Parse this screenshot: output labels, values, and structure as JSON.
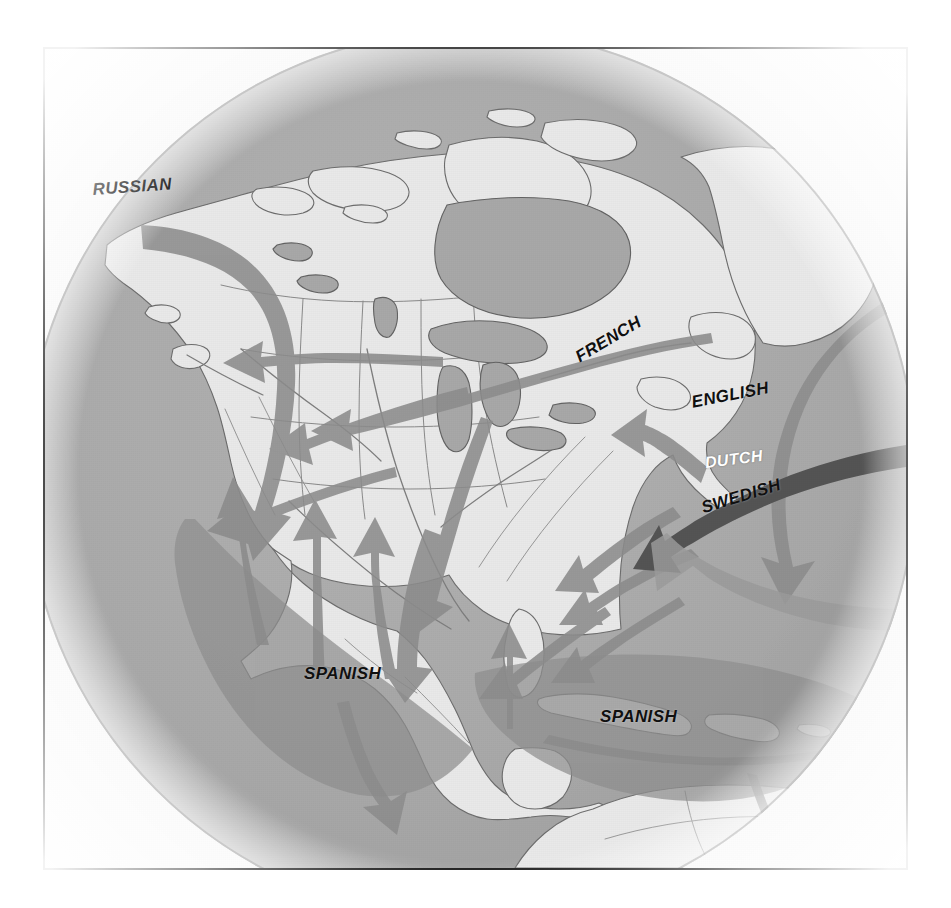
{
  "map": {
    "title": "Colonial language expansion in North America",
    "type": "thematic historical map",
    "projection": "orthographic globe centered on North America",
    "colors": {
      "ocean": "#a9a9a9",
      "land": "#e9e9e9",
      "arrow": "#8f8f8f",
      "arrow_dark": "#545454",
      "claim_zone": "#9a9a9a",
      "coastline": "#6a6a6a",
      "border_line": "#7a7a7a",
      "frame": "#1b1b1b",
      "outside": "#ffffff",
      "label_text": "#101010",
      "label_text_inverse": "#ffffff"
    },
    "labels": [
      {
        "id": "russian",
        "text": "RUSSIAN",
        "x": 90,
        "y": 178,
        "rotate": -4,
        "size": 17,
        "inverse": false
      },
      {
        "id": "french",
        "text": "FRENCH",
        "x": 570,
        "y": 348,
        "rotate": -31,
        "size": 17,
        "inverse": false
      },
      {
        "id": "english",
        "text": "ENGLISH",
        "x": 688,
        "y": 391,
        "rotate": -11,
        "size": 17,
        "inverse": false
      },
      {
        "id": "dutch",
        "text": "DUTCH",
        "x": 702,
        "y": 452,
        "rotate": -7,
        "size": 16,
        "inverse": true
      },
      {
        "id": "swedish",
        "text": "SWEDISH",
        "x": 697,
        "y": 497,
        "rotate": -17,
        "size": 17,
        "inverse": false
      },
      {
        "id": "spanish-mexico",
        "text": "SPANISH",
        "x": 302,
        "y": 662,
        "rotate": 0,
        "size": 17,
        "inverse": false
      },
      {
        "id": "spanish-caribbean",
        "text": "SPANISH",
        "x": 598,
        "y": 705,
        "rotate": 0,
        "size": 17,
        "inverse": false
      }
    ],
    "legend_note": "Arrows indicate direction of colonial settlement and linguistic expansion"
  }
}
